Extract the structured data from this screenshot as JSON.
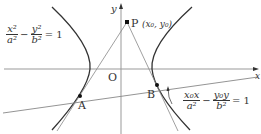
{
  "diagram": {
    "axes": {
      "x_label": "x",
      "y_label": "y",
      "origin_label": "O"
    },
    "points": {
      "P": {
        "label": "P",
        "coords": "(x₀, y₀)"
      },
      "A": {
        "label": "A"
      },
      "B": {
        "label": "B"
      }
    },
    "hyperbola_equation": {
      "term1_num": "x²",
      "term1_den": "a²",
      "minus": "−",
      "term2_num": "y²",
      "term2_den": "b²",
      "rhs": "= 1"
    },
    "polar_equation": {
      "term1_num": "x₀x",
      "term1_den": "a²",
      "minus": "−",
      "term2_num": "y₀y",
      "term2_den": "b²",
      "rhs": "= 1"
    },
    "colors": {
      "curve": "#333333",
      "line": "#888888",
      "axis": "#999999",
      "point": "#111111"
    }
  }
}
